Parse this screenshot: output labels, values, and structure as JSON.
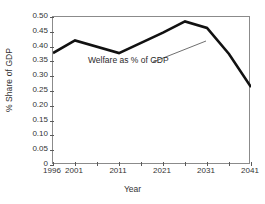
{
  "chart_data": {
    "type": "line",
    "title": "",
    "xlabel": "Year",
    "ylabel": "% Share of GDP",
    "xlim": [
      1996,
      2041
    ],
    "ylim": [
      0,
      0.5
    ],
    "grid": false,
    "legend": "none",
    "annotations": [
      {
        "text": "Welfare as % of GDP",
        "points_to_year": 2029,
        "points_to_value": 0.468
      }
    ],
    "y_ticks": [
      0,
      0.05,
      0.1,
      0.15,
      0.2,
      0.25,
      0.3,
      0.35,
      0.4,
      0.45,
      0.5
    ],
    "y_tick_labels": [
      "0",
      "0.05",
      "0.10",
      "0.15",
      "0.20",
      "0.25",
      "0.30",
      "0.35",
      "0.40",
      "0.45",
      "0.50"
    ],
    "x_ticks": [
      1996,
      2001,
      2006,
      2011,
      2016,
      2021,
      2026,
      2031,
      2036,
      2041
    ],
    "x_tick_labels": [
      "1996",
      "2001",
      "",
      "2011",
      "",
      "2021",
      "",
      "2031",
      "",
      "2041"
    ],
    "series": [
      {
        "name": "Welfare as % of GDP",
        "color": "#111111",
        "x": [
          1996,
          2001,
          2011,
          2021,
          2026,
          2031,
          2036,
          2041
        ],
        "values": [
          0.378,
          0.421,
          0.378,
          0.447,
          0.485,
          0.463,
          0.375,
          0.263
        ]
      }
    ]
  }
}
